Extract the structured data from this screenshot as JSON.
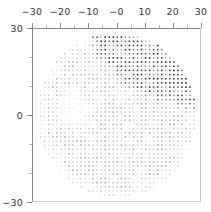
{
  "figure": {
    "background_color": "#ffffff",
    "frame_color": "#8c8c8c",
    "dot_color": "#808080"
  },
  "axes": {
    "x": {
      "position": "top",
      "labels": [
        "-30",
        "-20",
        "-10",
        "-0",
        "10",
        "20",
        "30"
      ],
      "tick_values": [
        -30,
        -20,
        -10,
        0,
        10,
        20,
        30
      ],
      "minor_tick_values": [
        -25,
        -15,
        -5,
        5,
        15,
        25
      ],
      "range": [
        -30,
        30
      ],
      "title": ""
    },
    "y": {
      "position": "left",
      "labels": [
        "30",
        "0",
        "-30"
      ],
      "tick_values": [
        30,
        0,
        -30
      ],
      "minor_tick_values": [
        20,
        10,
        -10,
        -20
      ],
      "range": [
        -30,
        30
      ],
      "title": ""
    }
  },
  "chart_data": {
    "type": "scatter",
    "title": "",
    "xlabel": "",
    "ylabel": "",
    "xlim": [
      -30,
      30
    ],
    "ylim": [
      -30,
      30
    ],
    "grid": false,
    "legend": null,
    "marker": {
      "shape": "square-dot",
      "size_px": 1.6,
      "lattice_spacing": 1.45,
      "color_min": "#f0f0f0",
      "color_max": "#404040"
    },
    "aperture": {
      "shape": "circle",
      "center": [
        0,
        0
      ],
      "radius": 28.5
    },
    "features": [
      {
        "name": "dark-wedge",
        "kind": "high-density-region",
        "vertices": [
          [
            -6,
            28
          ],
          [
            22,
            22
          ],
          [
            28,
            6
          ],
          [
            10,
            10
          ],
          [
            -2,
            20
          ]
        ],
        "mean_intensity": 0.72
      },
      {
        "name": "light-void",
        "kind": "low-density-region",
        "center": [
          -15.5,
          2.0
        ],
        "radius": 6.5,
        "mean_intensity": 0.04
      },
      {
        "name": "background-disc",
        "kind": "medium-density-region",
        "mean_intensity": 0.22
      }
    ],
    "sampled_profile": {
      "note": "mean marker intensity (0=white, 1=black) by radial ring",
      "radii": [
        0,
        4,
        8,
        12,
        16,
        20,
        24,
        28
      ],
      "values": [
        0.2,
        0.22,
        0.24,
        0.26,
        0.28,
        0.3,
        0.28,
        0.18
      ]
    }
  }
}
